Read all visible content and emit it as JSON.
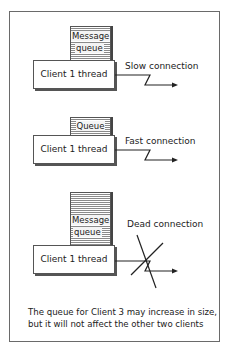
{
  "diagram": {
    "title": "",
    "panels": [
      {
        "queue_label_line1": "Message",
        "queue_label_line2": "queue",
        "client_label": "Client 1 thread",
        "connection_label": "Slow connection",
        "queue_size": "large"
      },
      {
        "queue_label_line1": "Queue",
        "client_label": "Client 1 thread",
        "connection_label": "Fast connection",
        "queue_size": "small"
      },
      {
        "queue_label_line1": "Message",
        "queue_label_line2": "queue",
        "client_label": "Client 1 thread",
        "connection_label": "Dead connection",
        "queue_size": "very large",
        "connection_crossed_out": true
      }
    ],
    "caption_line1": "The queue for Client 3 may increase in size,",
    "caption_line2": "but it will not affect the other two clients"
  },
  "colors": {
    "line": "#222222",
    "frame": "#6a6a6a",
    "queue_stripe": "#8a8a8a"
  }
}
